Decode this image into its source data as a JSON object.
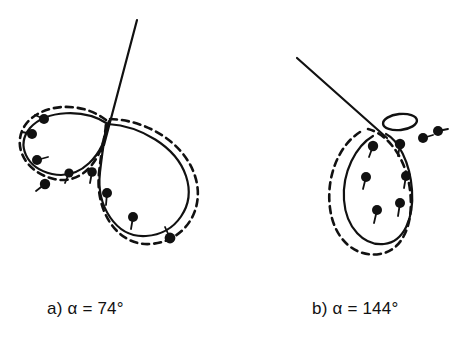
{
  "figure": {
    "background_color": "#ffffff",
    "stroke_color": "#111111",
    "panels": [
      {
        "id": "panel-a",
        "caption": "a) α = 74°",
        "alpha_label": "α",
        "alpha_value": "74°",
        "panel_letter": "a)",
        "description": "Two crossing teardrop loops with dashed outlines, straight tangent line, and eight marker dots with ticks",
        "crossing_point": [
          108,
          124
        ],
        "straight_line": {
          "x1": 137,
          "y1": 20,
          "x2": 104,
          "y2": 145
        },
        "solid_left_loop": "M108,124 C84,108 46,110 30,128 C16,145 26,168 52,174 C80,180 104,156 108,124 Z",
        "solid_right_loop": "M108,124 C140,126 176,146 186,176 C196,206 176,234 146,236 C116,238 96,206 100,172 C103,146 105,132 108,124 Z",
        "dashed_left_loop": "M106,120 C82,101 42,103 26,124 C11,144 24,172 54,179 C84,186 106,156 106,120 Z",
        "dashed_right_loop": "M110,119 C146,120 184,142 195,176 C206,210 184,242 150,244 C118,246 95,212 99,173 C102,145 106,128 110,119 Z",
        "dots": [
          {
            "x": 44,
            "y": 119,
            "tick_dx": -9,
            "tick_dy": -4
          },
          {
            "x": 32,
            "y": 134,
            "tick_dx": -10,
            "tick_dy": -2
          },
          {
            "x": 37,
            "y": 160,
            "tick_dx": 11,
            "tick_dy": -3
          },
          {
            "x": 45,
            "y": 184,
            "tick_dx": -9,
            "tick_dy": 7
          },
          {
            "x": 69,
            "y": 173,
            "tick_dx": -4,
            "tick_dy": 10
          },
          {
            "x": 92,
            "y": 172,
            "tick_dx": -2,
            "tick_dy": 11
          },
          {
            "x": 107,
            "y": 193,
            "tick_dx": -1,
            "tick_dy": 12
          },
          {
            "x": 133,
            "y": 217,
            "tick_dx": -2,
            "tick_dy": 12
          },
          {
            "x": 170,
            "y": 238,
            "tick_dx": -5,
            "tick_dy": -11
          }
        ]
      },
      {
        "id": "panel-b",
        "caption": "b) α = 144°",
        "alpha_label": "α",
        "alpha_value": "144°",
        "panel_letter": "b)",
        "description": "Straight line with small upper ellipse and large vertical teardrop loop with dashed outline and seven marker dots with ticks",
        "junction_point": [
          383,
          135
        ],
        "straight_line": {
          "x1": 297,
          "y1": 58,
          "x2": 387,
          "y2": 138
        },
        "small_ellipse": {
          "cx": 400,
          "cy": 122,
          "rx": 17,
          "ry": 8,
          "rotation": -6
        },
        "solid_loop": "M373,136 C356,146 342,172 344,200 C346,228 364,246 384,244 C404,242 414,218 412,190 C410,162 398,140 386,134",
        "dashed_loop": "M360,132 C338,146 326,178 330,208 C334,240 356,258 380,254 C404,250 414,222 410,190 C406,158 388,134 368,129",
        "dots": [
          {
            "x": 373,
            "y": 146,
            "tick_dx": -4,
            "tick_dy": 11
          },
          {
            "x": 400,
            "y": 144,
            "tick_dx": -2,
            "tick_dy": 12
          },
          {
            "x": 423,
            "y": 138,
            "tick_dx": 10,
            "tick_dy": -3
          },
          {
            "x": 438,
            "y": 131,
            "tick_dx": 10,
            "tick_dy": -2
          },
          {
            "x": 366,
            "y": 177,
            "tick_dx": -3,
            "tick_dy": 12
          },
          {
            "x": 406,
            "y": 176,
            "tick_dx": -2,
            "tick_dy": 12
          },
          {
            "x": 377,
            "y": 210,
            "tick_dx": -3,
            "tick_dy": 13
          },
          {
            "x": 400,
            "y": 203,
            "tick_dx": -2,
            "tick_dy": 13
          }
        ]
      }
    ]
  }
}
